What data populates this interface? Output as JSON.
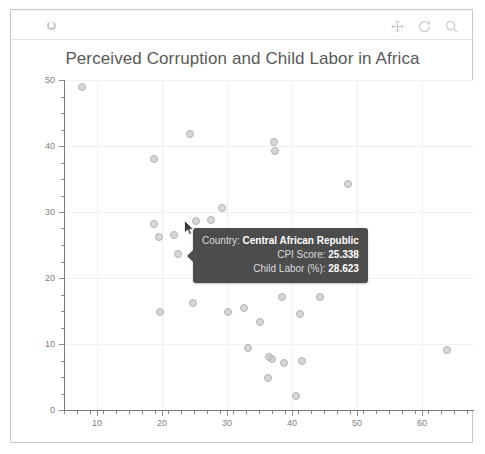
{
  "toolbar": {
    "spinner_icon": "loading-spinner-icon",
    "buttons": [
      {
        "name": "pan-icon",
        "title": "Pan"
      },
      {
        "name": "reset-axes-icon",
        "title": "Reset axes"
      },
      {
        "name": "zoom-icon",
        "title": "Zoom"
      }
    ]
  },
  "chart_data": {
    "type": "scatter",
    "title": "Perceived Corruption and Child Labor in Africa",
    "xlabel": "",
    "ylabel": "",
    "xlim": [
      5,
      68
    ],
    "ylim": [
      0,
      50
    ],
    "grid": true,
    "legend": false,
    "xticks": [
      "10",
      "20",
      "30",
      "40",
      "50",
      "60"
    ],
    "xtick_values": [
      10,
      20,
      30,
      40,
      50,
      60
    ],
    "yticks": [
      "0",
      "10",
      "20",
      "30",
      "40",
      "50"
    ],
    "ytick_values": [
      0,
      10,
      20,
      30,
      40,
      50
    ],
    "series_name": "African countries",
    "marker_color": "#bebebe",
    "points": [
      {
        "x": 7.8,
        "y": 49.0
      },
      {
        "x": 18.8,
        "y": 38.1
      },
      {
        "x": 24.3,
        "y": 41.8
      },
      {
        "x": 37.3,
        "y": 40.6
      },
      {
        "x": 37.4,
        "y": 39.2
      },
      {
        "x": 48.6,
        "y": 34.2
      },
      {
        "x": 18.8,
        "y": 28.2
      },
      {
        "x": 19.6,
        "y": 26.2
      },
      {
        "x": 21.9,
        "y": 26.5
      },
      {
        "x": 25.3,
        "y": 28.6
      },
      {
        "x": 22.5,
        "y": 23.7
      },
      {
        "x": 27.6,
        "y": 28.8
      },
      {
        "x": 29.3,
        "y": 30.6
      },
      {
        "x": 25.9,
        "y": 24.6
      },
      {
        "x": 25.9,
        "y": 23.6
      },
      {
        "x": 25.9,
        "y": 22.6
      },
      {
        "x": 31.0,
        "y": 22.6
      },
      {
        "x": 31.3,
        "y": 25.2
      },
      {
        "x": 37.8,
        "y": 23.0
      },
      {
        "x": 48.8,
        "y": 22.9
      },
      {
        "x": 26.6,
        "y": 20.0
      },
      {
        "x": 24.8,
        "y": 16.2
      },
      {
        "x": 19.7,
        "y": 14.8
      },
      {
        "x": 30.2,
        "y": 14.8
      },
      {
        "x": 32.7,
        "y": 15.4
      },
      {
        "x": 35.1,
        "y": 13.4
      },
      {
        "x": 41.3,
        "y": 14.5
      },
      {
        "x": 38.5,
        "y": 17.2
      },
      {
        "x": 44.3,
        "y": 17.1
      },
      {
        "x": 33.3,
        "y": 9.4
      },
      {
        "x": 36.5,
        "y": 8.0
      },
      {
        "x": 37.0,
        "y": 7.8
      },
      {
        "x": 38.8,
        "y": 7.2
      },
      {
        "x": 41.6,
        "y": 7.4
      },
      {
        "x": 36.3,
        "y": 4.8
      },
      {
        "x": 40.7,
        "y": 2.2
      },
      {
        "x": 63.8,
        "y": 9.1
      }
    ]
  },
  "tooltip": {
    "visible": true,
    "rows": [
      {
        "label": "Country:",
        "value": "Central African Republic"
      },
      {
        "label": "CPI Score:",
        "value": "25.338"
      },
      {
        "label": "Child Labor (%):",
        "value": "28.623"
      }
    ]
  },
  "cursor": {
    "name": "mouse-pointer",
    "x": 173,
    "y": 210
  }
}
